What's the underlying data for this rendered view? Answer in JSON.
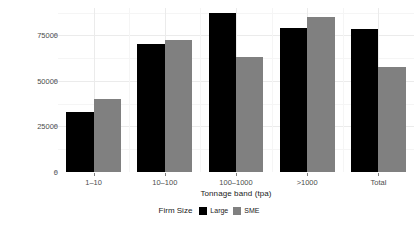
{
  "chart_data": {
    "type": "bar",
    "title": "",
    "xlabel": "Tonnage band (tpa)",
    "ylabel": "Average cost (€)",
    "categories": [
      "1–10",
      "10–100",
      "100–1000",
      ">1000",
      "Total"
    ],
    "series": [
      {
        "name": "Large",
        "color": "#000000",
        "values": [
          33000,
          70500,
          87500,
          79000,
          78400
        ]
      },
      {
        "name": "SME",
        "color": "#808080",
        "values": [
          40300,
          72700,
          63000,
          85200,
          57400
        ]
      }
    ],
    "ylim": [
      0,
      90000
    ],
    "yticks": [
      0,
      25000,
      50000,
      75000
    ],
    "ytick_labels": [
      "0",
      "25000",
      "50000",
      "75000"
    ],
    "grid": true,
    "legend_position": "bottom",
    "legend_title": "Firm Size"
  },
  "legend": {
    "title": "Firm Size",
    "entries": [
      {
        "label": "Large",
        "color": "#000000"
      },
      {
        "label": "SME",
        "color": "#808080"
      }
    ]
  }
}
